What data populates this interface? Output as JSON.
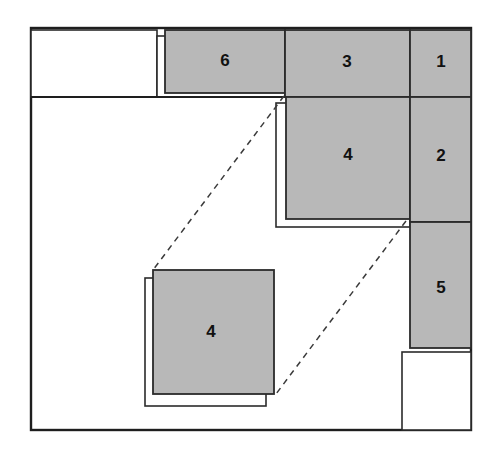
{
  "figure": {
    "type": "packing-diagram",
    "canvas": {
      "width": 494,
      "height": 456,
      "background": "#ffffff"
    },
    "colors": {
      "block_fill": "#b8b8b8",
      "block_stroke": "#2b2b2b",
      "outline_stroke": "#2b2b2b",
      "dashed_stroke": "#3a3a3a",
      "border_stroke": "#1e1e1e",
      "empty_fill": "#ffffff"
    },
    "container": {
      "x": 31,
      "y": 28,
      "width": 440,
      "height": 402,
      "label": ""
    },
    "blocks": [
      {
        "id": "block-6",
        "label": "6",
        "x": 165,
        "y": 30,
        "width": 120,
        "height": 63,
        "label_x": 225,
        "label_y": 62
      },
      {
        "id": "block-3",
        "label": "3",
        "x": 285,
        "y": 30,
        "width": 125,
        "height": 67,
        "label_x": 347,
        "label_y": 63
      },
      {
        "id": "block-1",
        "label": "1",
        "x": 410,
        "y": 30,
        "width": 61,
        "height": 67,
        "label_x": 441,
        "label_y": 63
      },
      {
        "id": "block-4-top",
        "label": "4",
        "x": 286,
        "y": 97,
        "width": 124,
        "height": 122,
        "label_x": 348,
        "label_y": 156
      },
      {
        "id": "block-2",
        "label": "2",
        "x": 410,
        "y": 97,
        "width": 61,
        "height": 125,
        "label_x": 441,
        "label_y": 157
      },
      {
        "id": "block-5",
        "label": "5",
        "x": 410,
        "y": 222,
        "width": 61,
        "height": 126,
        "label_x": 441,
        "label_y": 289
      },
      {
        "id": "block-4-bottom",
        "label": "4",
        "x": 153,
        "y": 270,
        "width": 121,
        "height": 124,
        "label_x": 211,
        "label_y": 333
      }
    ],
    "outline_boxes": [
      {
        "id": "outline-free-topleft",
        "x": 31,
        "y": 30,
        "width": 126,
        "height": 67
      },
      {
        "id": "outline-slot-top",
        "x": 157,
        "y": 36,
        "width": 128,
        "height": 61
      },
      {
        "id": "outline-slot-right",
        "x": 276,
        "y": 103,
        "width": 134,
        "height": 124
      },
      {
        "id": "outline-slot-bottom",
        "x": 145,
        "y": 278,
        "width": 121,
        "height": 128
      },
      {
        "id": "outline-free-bottomright",
        "x": 402,
        "y": 352,
        "width": 69,
        "height": 78
      }
    ],
    "dashed_lines": [
      {
        "id": "dashed-guide-upper",
        "x1": 284,
        "y1": 96,
        "x2": 153,
        "y2": 270
      },
      {
        "id": "dashed-guide-lower",
        "x1": 406,
        "y1": 221,
        "x2": 276,
        "y2": 394
      }
    ],
    "divider_lines": [
      {
        "id": "divider-left-horizontal",
        "x1": 31,
        "y1": 97,
        "x2": 285,
        "y2": 97
      }
    ]
  }
}
